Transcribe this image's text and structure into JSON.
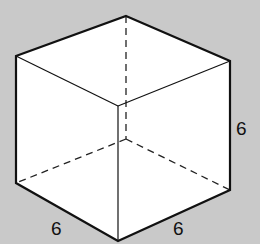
{
  "figure": {
    "type": "cube",
    "background": "#c9c9c9",
    "face_fill": "#ffffff",
    "stroke": "#111111",
    "vertices": {
      "top_back": [
        126,
        16
      ],
      "top_left": [
        16,
        56
      ],
      "top_right": [
        230,
        61
      ],
      "top_front": [
        118,
        106
      ],
      "bottom_left": [
        16,
        183
      ],
      "bottom_right": [
        230,
        190
      ],
      "bottom_front": [
        118,
        241
      ],
      "hidden_back": [
        126,
        139
      ]
    },
    "labels": {
      "height": "6",
      "left_width": "6",
      "right_depth": "6"
    }
  }
}
